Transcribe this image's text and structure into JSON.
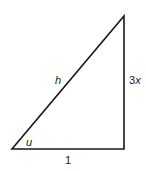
{
  "diagram": {
    "type": "right-triangle",
    "labels": {
      "hypotenuse": "h",
      "angle": "u",
      "base": "1",
      "height_num": "3",
      "height_var": "x"
    },
    "vertices": {
      "bottom_left": [
        12,
        149
      ],
      "bottom_right": [
        124,
        149
      ],
      "top": [
        124,
        16
      ]
    },
    "colors": {
      "stroke": "#1a1a1a",
      "background": "#ffffff"
    }
  }
}
